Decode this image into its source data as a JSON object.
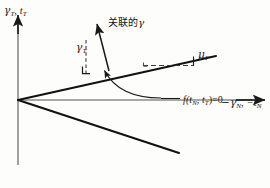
{
  "figure": {
    "type": "line-diagram",
    "caption_absent": true,
    "background_color": "#fdfdfc",
    "ink_color": "#1a1a1a",
    "width": 270,
    "height": 188
  },
  "axes": {
    "y_axis": {
      "label_main": "γ",
      "label_main_sub": "T",
      "separator": ", ",
      "label_second": "t",
      "label_second_sub": "T",
      "full_text": "γT, tT",
      "direction": "up",
      "arrow": true
    },
    "x_axis": {
      "label_main": "−γ",
      "label_main_sub": "N",
      "separator": ", ",
      "label_second": "−t",
      "label_second_sub": "N",
      "full_text": "−γN, −tN",
      "direction": "right",
      "arrow": true
    }
  },
  "annotations": {
    "associated_gamma": {
      "text_cn": "关联的",
      "symbol": "γ",
      "full_text": "关联的 γ",
      "meaning": "associated gamma"
    },
    "gamma_t_component": {
      "symbol": "γ",
      "subscript": "T",
      "full_text": "γT"
    },
    "friction_coefficient": {
      "symbol": "μ",
      "subscript": "F",
      "full_text": "μF"
    },
    "yield_function": {
      "text": "f(tN, tT)=0",
      "prefix": "f(",
      "arg1": "t",
      "arg1_sub": "N",
      "comma": ", ",
      "arg2": "t",
      "arg2_sub": "T",
      "suffix": ")=0"
    }
  },
  "geometry": {
    "origin": {
      "x": 18,
      "y": 100
    },
    "y_axis_line": {
      "x1": 18,
      "y1": 165,
      "x2": 18,
      "y2": 14
    },
    "x_axis_line": {
      "x1": 18,
      "y1": 100,
      "x2": 266,
      "y2": 100
    },
    "upper_yield_line": {
      "x1": 18,
      "y1": 100,
      "x2": 216,
      "y2": 56
    },
    "lower_yield_line": {
      "x1": 18,
      "y1": 100,
      "x2": 179,
      "y2": 153
    },
    "flow_vector_arrow": {
      "x1": 109,
      "y1": 70,
      "x2": 96,
      "y2": 22
    },
    "dashed_vertical": {
      "x1": 86,
      "y1": 42,
      "x2": 86,
      "y2": 73
    },
    "dashed_horizontal_mu": {
      "x1": 144,
      "y1": 65,
      "x2": 194,
      "y2": 65
    },
    "mu_tick": {
      "x1": 194,
      "y1": 65,
      "x2": 194,
      "y2": 57
    },
    "right_angle_marker": {
      "x": 84,
      "y": 69,
      "size": 7
    },
    "curved_pointer": {
      "start": {
        "x": 160,
        "y": 98
      },
      "control1": {
        "x": 128,
        "y": 98
      },
      "control2": {
        "x": 112,
        "y": 86
      },
      "end": {
        "x": 103,
        "y": 69
      }
    }
  }
}
